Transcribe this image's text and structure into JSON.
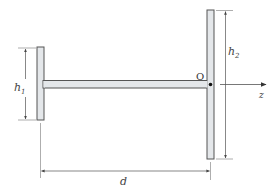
{
  "diagram": {
    "type": "beam-cross-section",
    "colors": {
      "section_fill": "#e4e7ea",
      "section_stroke": "#555555",
      "dimension_line": "#555555",
      "text": "#444444",
      "background": "#ffffff"
    },
    "labels": {
      "h1": "h",
      "h1_sub": "1",
      "h2": "h",
      "h2_sub": "2",
      "d": "d",
      "origin": "O",
      "axis": "z"
    },
    "dimensions": [
      {
        "name": "h1",
        "description": "height of left flange"
      },
      {
        "name": "h2",
        "description": "height of right flange"
      },
      {
        "name": "d",
        "description": "distance between flanges"
      }
    ]
  }
}
